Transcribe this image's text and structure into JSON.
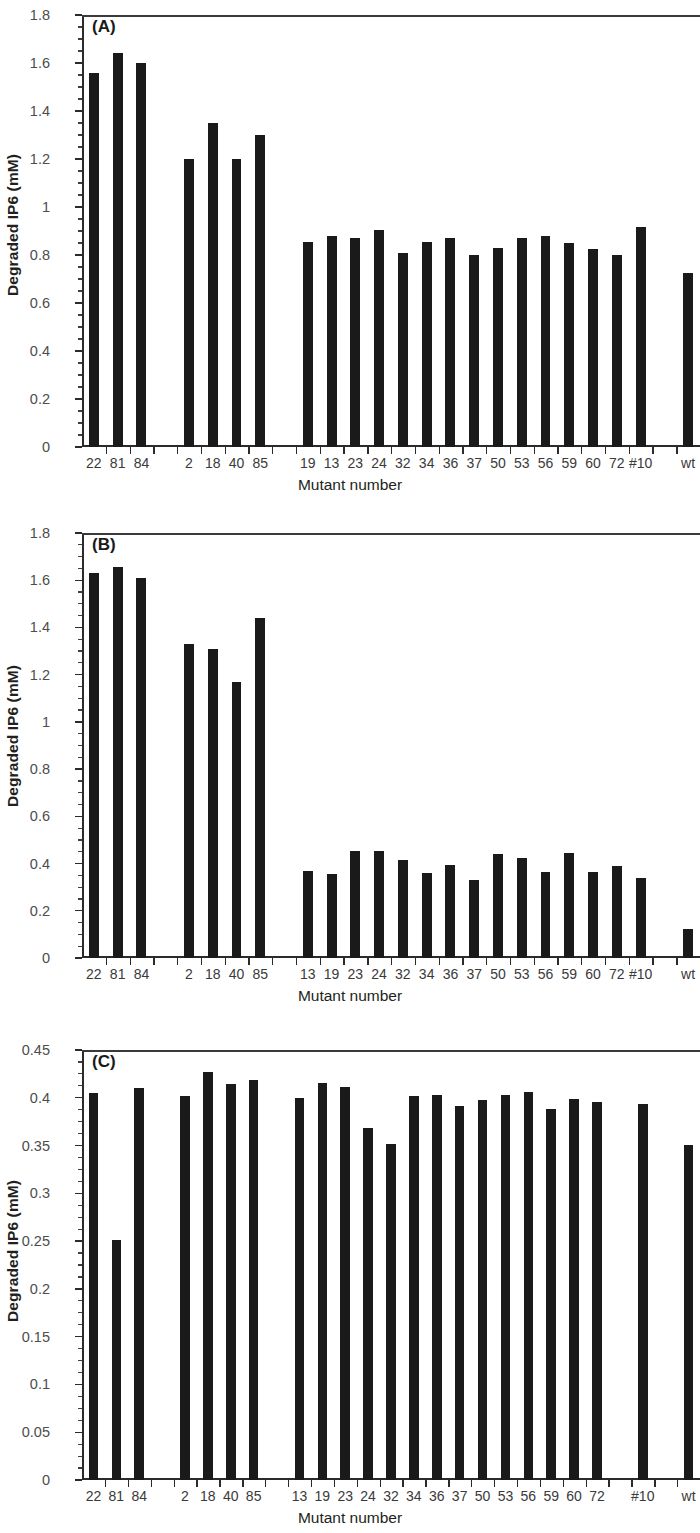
{
  "figure": {
    "panels": [
      "A",
      "B",
      "C"
    ],
    "shared_xlabel": "Mutant number",
    "shared_ylabel": "Degraded IP6 (mM)",
    "bar_color": "#1a1a1a",
    "axis_color": "#2b2b2b"
  },
  "panelA": {
    "tag": "(A)",
    "xlabel": "Mutant number",
    "ylabel": "Degraded IP6 (mM)",
    "yticks": [
      "0",
      "0.2",
      "0.4",
      "0.6",
      "0.8",
      "1",
      "1.2",
      "1.4",
      "1.6",
      "1.8"
    ]
  },
  "panelB": {
    "tag": "(B)",
    "xlabel": "Mutant number",
    "ylabel": "Degraded IP6 (mM)",
    "yticks": [
      "0",
      "0.2",
      "0.4",
      "0.6",
      "0.8",
      "1",
      "1.2",
      "1.4",
      "1.6",
      "1.8"
    ]
  },
  "panelC": {
    "tag": "(C)",
    "xlabel": "Mutant number",
    "ylabel": "Degraded IP6 (mM)",
    "yticks": [
      "0",
      "0.05",
      "0.1",
      "0.15",
      "0.2",
      "0.25",
      "0.3",
      "0.35",
      "0.4",
      "0.45"
    ]
  },
  "chart_data": [
    {
      "type": "bar",
      "panel": "A",
      "title": "(A)",
      "xlabel": "Mutant number",
      "ylabel": "Degraded IP6 (mM)",
      "ylim": [
        0,
        1.8
      ],
      "ytick_step": 0.2,
      "minor_tick_step": 0.05,
      "grid": false,
      "legend": null,
      "categories": [
        "22",
        "81",
        "84",
        "",
        "2",
        "18",
        "40",
        "85",
        "",
        "19",
        "13",
        "23",
        "24",
        "32",
        "34",
        "36",
        "37",
        "50",
        "53",
        "56",
        "59",
        "60",
        "72",
        "#10",
        "",
        "wt"
      ],
      "values": [
        1.56,
        1.64,
        1.6,
        null,
        1.2,
        1.35,
        1.2,
        1.3,
        null,
        0.855,
        0.88,
        0.87,
        0.905,
        0.81,
        0.855,
        0.87,
        0.8,
        0.83,
        0.87,
        0.88,
        0.85,
        0.825,
        0.8,
        0.915,
        null,
        0.725
      ]
    },
    {
      "type": "bar",
      "panel": "B",
      "title": "(B)",
      "xlabel": "Mutant number",
      "ylabel": "Degraded IP6 (mM)",
      "ylim": [
        0,
        1.8
      ],
      "ytick_step": 0.2,
      "minor_tick_step": 0.05,
      "grid": false,
      "legend": null,
      "categories": [
        "22",
        "81",
        "84",
        "",
        "2",
        "18",
        "40",
        "85",
        "",
        "13",
        "19",
        "23",
        "24",
        "32",
        "34",
        "36",
        "37",
        "50",
        "53",
        "56",
        "59",
        "60",
        "72",
        "#10",
        "",
        "wt"
      ],
      "values": [
        1.63,
        1.655,
        1.61,
        null,
        1.33,
        1.31,
        1.17,
        1.44,
        null,
        0.37,
        0.355,
        0.455,
        0.455,
        0.415,
        0.36,
        0.395,
        0.33,
        0.44,
        0.425,
        0.365,
        0.445,
        0.365,
        0.39,
        0.34,
        null,
        0.125
      ]
    },
    {
      "type": "bar",
      "panel": "C",
      "title": "(C)",
      "xlabel": "Mutant number",
      "ylabel": "Degraded IP6 (mM)",
      "ylim": [
        0,
        0.45
      ],
      "ytick_step": 0.05,
      "minor_tick_step": 0.0125,
      "grid": false,
      "legend": null,
      "categories": [
        "22",
        "81",
        "84",
        "",
        "2",
        "18",
        "40",
        "85",
        "",
        "13",
        "19",
        "23",
        "24",
        "32",
        "34",
        "36",
        "37",
        "50",
        "53",
        "56",
        "59",
        "60",
        "72",
        "",
        "#10",
        "",
        "wt"
      ],
      "values": [
        0.405,
        0.251,
        0.41,
        null,
        0.402,
        0.427,
        0.414,
        0.419,
        null,
        0.4,
        0.416,
        0.411,
        0.368,
        0.352,
        0.402,
        0.403,
        0.391,
        0.398,
        0.403,
        0.406,
        0.388,
        0.399,
        0.396,
        null,
        0.394,
        null,
        0.351
      ]
    }
  ]
}
